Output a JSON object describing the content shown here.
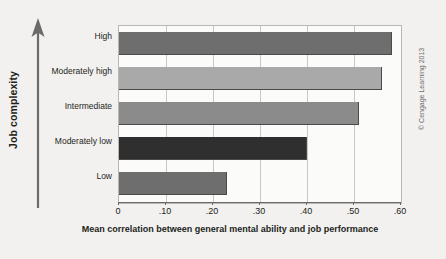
{
  "chart_data": {
    "type": "bar",
    "orientation": "horizontal",
    "title": "",
    "xlabel": "Mean correlation between general mental ability and job performance",
    "ylabel": "Job complexity",
    "categories": [
      "High",
      "Moderately high",
      "Intermediate",
      "Moderately low",
      "Low"
    ],
    "values": [
      0.58,
      0.56,
      0.51,
      0.4,
      0.23
    ],
    "bar_colors": [
      "#6e6e6e",
      "#a9a9a9",
      "#8b8b8b",
      "#2f2f2f",
      "#6e6e6e"
    ],
    "xlim": [
      0,
      0.6
    ],
    "xticks": [
      0,
      0.1,
      0.2,
      0.3,
      0.4,
      0.5,
      0.6
    ],
    "xtick_labels": [
      "0",
      ".10",
      ".20",
      ".30",
      ".40",
      ".50",
      ".60"
    ],
    "grid": "vertical",
    "legend": "none"
  },
  "figure": {
    "background_color": "#f2f1ef",
    "plot_background_color": "#fbfbfa",
    "plot_border_color": "#b9b7b4",
    "gridline_color": "#c9c7c4",
    "axis_color": "#6d6b68",
    "text_color": "#231f20"
  },
  "y_axis": {
    "title": "Job complexity",
    "arrow_direction": "up",
    "arrow_color": "#6d6b68"
  },
  "x_axis": {
    "title": "Mean correlation between general mental ability and job performance"
  },
  "credit": {
    "text": "© Cengage Learning 2013"
  }
}
